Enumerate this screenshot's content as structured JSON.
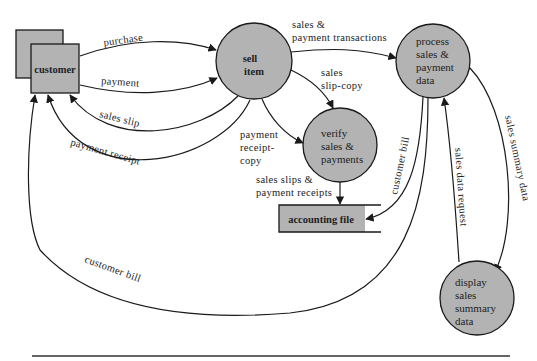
{
  "diagram": {
    "type": "data-flow-diagram",
    "colors": {
      "fill": "#b3b3b3",
      "stroke": "#1a1a1a",
      "background": "#ffffff"
    },
    "external_entities": [
      {
        "id": "customer",
        "label": "customer"
      }
    ],
    "processes": [
      {
        "id": "sell",
        "lines": [
          "sell",
          "item"
        ]
      },
      {
        "id": "process",
        "lines": [
          "process",
          "sales &",
          "payment",
          "data"
        ]
      },
      {
        "id": "verify",
        "lines": [
          "verify",
          "sales &",
          "payments"
        ]
      },
      {
        "id": "display",
        "lines": [
          "display",
          "sales",
          "summary",
          "data"
        ]
      }
    ],
    "data_stores": [
      {
        "id": "accounting",
        "label": "accounting file"
      }
    ],
    "flows": [
      {
        "id": "purchase",
        "from": "customer",
        "to": "sell",
        "lines": [
          "purchase"
        ]
      },
      {
        "id": "payment",
        "from": "customer",
        "to": "sell",
        "lines": [
          "payment"
        ]
      },
      {
        "id": "sales_slip",
        "from": "sell",
        "to": "customer",
        "lines": [
          "sales slip"
        ]
      },
      {
        "id": "payment_receipt",
        "from": "sell",
        "to": "customer",
        "lines": [
          "payment receipt"
        ]
      },
      {
        "id": "transactions",
        "from": "sell",
        "to": "process",
        "lines": [
          "sales &",
          "payment transactions"
        ]
      },
      {
        "id": "slip_copy",
        "from": "sell",
        "to": "verify",
        "lines": [
          "sales",
          "slip-copy"
        ]
      },
      {
        "id": "receipt_copy",
        "from": "sell",
        "to": "verify",
        "lines": [
          "payment",
          "receipt-",
          "copy"
        ]
      },
      {
        "id": "slips_receipts",
        "from": "verify",
        "to": "accounting",
        "lines": [
          "sales slips &",
          "payment receipts"
        ]
      },
      {
        "id": "bill_store",
        "from": "process",
        "to": "accounting",
        "lines": [
          "customer bill"
        ]
      },
      {
        "id": "bill_customer",
        "from": "process",
        "to": "customer",
        "lines": [
          "customer bill"
        ]
      },
      {
        "id": "data_request",
        "from": "display",
        "to": "process",
        "lines": [
          "sales data request"
        ]
      },
      {
        "id": "summary_data",
        "from": "process",
        "to": "display",
        "lines": [
          "sales summary data"
        ]
      }
    ]
  }
}
